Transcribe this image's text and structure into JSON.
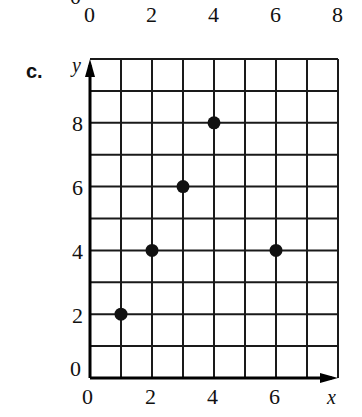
{
  "previous_chart": {
    "cut_label": "0",
    "x_tick_labels": [
      "0",
      "2",
      "4",
      "6",
      "8"
    ]
  },
  "chart_data": {
    "type": "scatter",
    "title": "c.",
    "xlabel": "x",
    "ylabel": "y",
    "xlim": [
      0,
      8
    ],
    "ylim": [
      0,
      10
    ],
    "grid": true,
    "x_ticks": [
      "0",
      "2",
      "4",
      "6"
    ],
    "y_ticks": [
      "0",
      "2",
      "4",
      "6",
      "8"
    ],
    "points": [
      {
        "x": 1,
        "y": 2
      },
      {
        "x": 2,
        "y": 4
      },
      {
        "x": 3,
        "y": 6
      },
      {
        "x": 4,
        "y": 8
      },
      {
        "x": 6,
        "y": 4
      }
    ],
    "marker_color": "#111111",
    "grid_color": "#1a1a1a"
  }
}
